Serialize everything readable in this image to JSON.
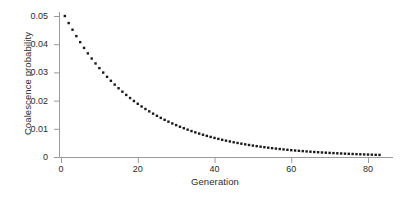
{
  "chart_data": {
    "type": "scatter",
    "title": "",
    "subtitle": "",
    "xlabel": "Generation",
    "ylabel": "Coalescence probability",
    "xlim": [
      0,
      84
    ],
    "ylim": [
      0,
      0.05
    ],
    "xticks": [
      0,
      20,
      40,
      60,
      80
    ],
    "xticklabels": [
      "0",
      "20",
      "40",
      "60",
      "80"
    ],
    "yticks": [
      0,
      0.01,
      0.02,
      0.03,
      0.04,
      0.05
    ],
    "yticklabels": [
      "0",
      "0.01",
      "0.02",
      "0.03",
      "0.04",
      "0.05"
    ],
    "grid": false,
    "legend": null,
    "marker": "square-dot",
    "marker_size_px": 2.4,
    "marker_color": "#1a1a1a",
    "axis_color": "#9a9a9a",
    "annotations": [],
    "series": [
      {
        "name": "Coalescence probability",
        "description": "Geometric decay, p(t) = 0.05 * 0.95^(t-1), N = 10 diploid individuals (1/2N = 0.05)",
        "x": [
          1,
          2,
          3,
          4,
          5,
          6,
          7,
          8,
          9,
          10,
          11,
          12,
          13,
          14,
          15,
          16,
          17,
          18,
          19,
          20,
          21,
          22,
          23,
          24,
          25,
          26,
          27,
          28,
          29,
          30,
          31,
          32,
          33,
          34,
          35,
          36,
          37,
          38,
          39,
          40,
          41,
          42,
          43,
          44,
          45,
          46,
          47,
          48,
          49,
          50,
          51,
          52,
          53,
          54,
          55,
          56,
          57,
          58,
          59,
          60,
          61,
          62,
          63,
          64,
          65,
          66,
          67,
          68,
          69,
          70,
          71,
          72,
          73,
          74,
          75,
          76,
          77,
          78,
          79,
          80,
          81,
          82,
          83
        ],
        "y": [
          0.05,
          0.0475,
          0.04513,
          0.04287,
          0.04073,
          0.03869,
          0.03675,
          0.03492,
          0.03317,
          0.03151,
          0.02994,
          0.02844,
          0.02702,
          0.02567,
          0.02438,
          0.02316,
          0.02201,
          0.02091,
          0.01986,
          0.01887,
          0.01792,
          0.01703,
          0.01618,
          0.01537,
          0.0146,
          0.01387,
          0.01318,
          0.01252,
          0.01189,
          0.0113,
          0.01073,
          0.0102,
          0.00969,
          0.0092,
          0.00874,
          0.0083,
          0.00789,
          0.00749,
          0.00712,
          0.00676,
          0.00643,
          0.0061,
          0.0058,
          0.00551,
          0.00523,
          0.00497,
          0.00472,
          0.00449,
          0.00426,
          0.00405,
          0.00385,
          0.00366,
          0.00347,
          0.0033,
          0.00313,
          0.00298,
          0.00283,
          0.00269,
          0.00255,
          0.00242,
          0.0023,
          0.00219,
          0.00208,
          0.00198,
          0.00188,
          0.00178,
          0.00169,
          0.00161,
          0.00153,
          0.00145,
          0.00138,
          0.00131,
          0.00125,
          0.00118,
          0.00112,
          0.00107,
          0.00101,
          0.00096,
          0.00091,
          0.00087,
          0.00082,
          0.00078,
          0.00074
        ]
      }
    ]
  },
  "axes": {
    "y_title": "Coalescence probability",
    "x_title": "Generation"
  }
}
